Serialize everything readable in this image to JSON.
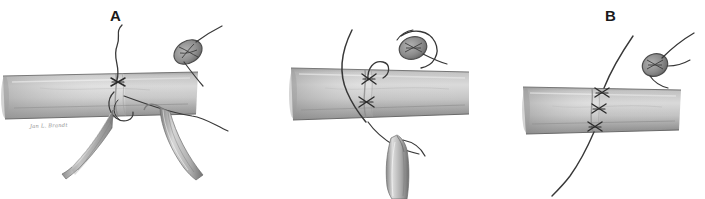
{
  "figure": {
    "kind": "medical-surgical-illustration",
    "medium": "graphite pencil drawing",
    "background_color": "#ffffff",
    "width_px": 705,
    "height_px": 199,
    "panel_count": 3,
    "signature_text": "Jan L. Brandt"
  },
  "palette": {
    "background": "#ffffff",
    "vessel_light": "#dcdcdc",
    "vessel_mid": "#b9b9b9",
    "vessel_dark": "#8e8e8e",
    "vessel_edge": "#6f6f6f",
    "suture_thread": "#3a3a3a",
    "knot_dark": "#2b2b2b",
    "instrument_light": "#e2e2e2",
    "instrument_mid": "#a8a8a8",
    "instrument_dark": "#6a6a6a",
    "label_text": "#1a1a1a",
    "signature_text": "#8d8d8d"
  },
  "panels": [
    {
      "id": "a",
      "label": "A",
      "label_x": 110,
      "caption_role": "First stitch placed; cut ends of the vessel held apart by two forceps while the suture is drawn through",
      "elements": {
        "vessel": "horizontal tubular vessel shaded cylinder",
        "suture_tail_top": "long thread rising from knot toward label",
        "suture_tail_right": "thread trailing off to the right",
        "knot": "cross knot at vessel midline",
        "instruments": "two forceps grasping the vessel edges from below",
        "inset": "magnified oval knot detail upper right"
      },
      "signature": "Jan L. Brandt",
      "signature_x": 30,
      "signature_y": 124
    },
    {
      "id": "b",
      "label": "B",
      "label_x": 370,
      "caption_role": "Needle passed through both walls; loop of suture pulled up and a single forceps supports the tube from below",
      "elements": {
        "vessel": "horizontal tubular vessel shaded cylinder",
        "suture_long_arc": "long curved thread sweeping from top-left down through vessel",
        "suture_loop": "small loop of thread above the vessel",
        "knots": "two cross knots stacked on the vessel face",
        "instrument": "single forceps tip below the vessel holding thread",
        "inset": "magnified oval knot detail with encircling thread upper right"
      },
      "signature": "Jan L. Brandt",
      "signature_x": 311,
      "signature_y": 128
    },
    {
      "id": "c",
      "label": "C",
      "label_x": 580,
      "caption_role": "Completed repair: row of three interrupted knots along the closed vessel with the final suture end trailing",
      "elements": {
        "vessel": "horizontal tubular vessel shaded cylinder",
        "suture_line": "continuous thread crossing the vessel diagonally",
        "knots": "three cross knots evenly spaced down the suture line",
        "inset": "magnified oval knot detail with thread upper right"
      },
      "signature": "Jan L. Brandt",
      "signature_x": 597,
      "signature_y": 143
    }
  ]
}
